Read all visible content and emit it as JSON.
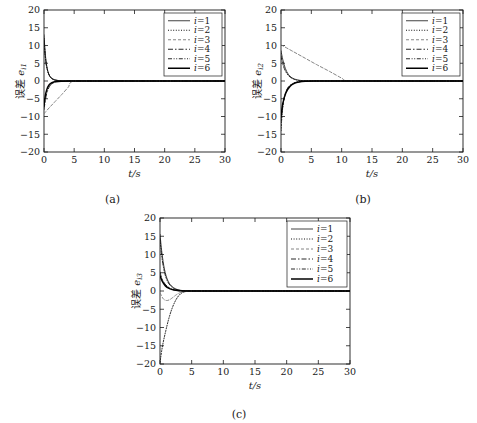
{
  "figure": {
    "title": "",
    "panels": [
      {
        "id": "a",
        "caption": "(a)",
        "xlabel": "t/s",
        "ylabel_cn": "误差",
        "ylabel_sym": "e",
        "ylabel_sub": "i1"
      },
      {
        "id": "b",
        "caption": "(b)",
        "xlabel": "t/s",
        "ylabel_cn": "误差",
        "ylabel_sym": "e",
        "ylabel_sub": "i2"
      },
      {
        "id": "c",
        "caption": "(c)",
        "xlabel": "t/s",
        "ylabel_cn": "误差",
        "ylabel_sym": "e",
        "ylabel_sub": "i3"
      }
    ],
    "legend_entries": [
      {
        "label": "i=1",
        "style": "solid-thin",
        "color": "#111111"
      },
      {
        "label": "i=2",
        "style": "dotted",
        "color": "#111111"
      },
      {
        "label": "i=3",
        "style": "dashed",
        "color": "#777777"
      },
      {
        "label": "i=4",
        "style": "dashdot",
        "color": "#111111"
      },
      {
        "label": "i=5",
        "style": "dashdotdot",
        "color": "#111111"
      },
      {
        "label": "i=6",
        "style": "solid-thick",
        "color": "#000000"
      }
    ]
  },
  "chart_data": [
    {
      "type": "line",
      "panel": "a",
      "title": "",
      "xlabel": "t/s",
      "ylabel": "误差 e_i1",
      "xlim": [
        0,
        30
      ],
      "ylim": [
        -20,
        20
      ],
      "xticks": [
        0,
        5,
        10,
        15,
        20,
        25,
        30
      ],
      "yticks": [
        -20,
        -15,
        -10,
        -5,
        0,
        5,
        10,
        15,
        20
      ],
      "grid": false,
      "legend_position": "top-right",
      "series": [
        {
          "name": "i=1",
          "style": "solid-thin",
          "color": "#111111",
          "x": [
            0,
            0.15,
            0.3,
            0.5,
            0.8,
            1.2,
            1.8,
            2.5,
            3.5,
            5,
            8,
            15,
            30
          ],
          "y": [
            13.0,
            9.0,
            6.2,
            3.8,
            1.9,
            0.8,
            0.25,
            0.08,
            0.02,
            0.0,
            0.0,
            0.0,
            0.0
          ]
        },
        {
          "name": "i=2",
          "style": "dotted",
          "color": "#111111",
          "x": [
            0,
            0.2,
            0.4,
            0.7,
            1.1,
            1.7,
            2.5,
            3.5,
            5,
            10,
            30
          ],
          "y": [
            12.0,
            7.5,
            4.5,
            2.3,
            1.0,
            0.35,
            0.1,
            0.03,
            0.0,
            0.0,
            0.0
          ]
        },
        {
          "name": "i=3",
          "style": "dashed",
          "color": "#777777",
          "x": [
            0,
            1,
            2,
            3,
            4,
            5,
            10,
            20,
            30
          ],
          "y": [
            -9.2,
            -7.3,
            -5.5,
            -3.7,
            -1.8,
            0.0,
            0.0,
            0.0,
            0.0
          ]
        },
        {
          "name": "i=4",
          "style": "dashdot",
          "color": "#111111",
          "x": [
            0,
            0.25,
            0.5,
            0.9,
            1.4,
            2.0,
            3.0,
            4.5,
            8,
            30
          ],
          "y": [
            -8.0,
            -5.2,
            -3.2,
            -1.6,
            -0.7,
            -0.25,
            -0.06,
            -0.01,
            0.0,
            0.0
          ]
        },
        {
          "name": "i=5",
          "style": "dashdotdot",
          "color": "#111111",
          "x": [
            0,
            0.2,
            0.45,
            0.8,
            1.3,
            2.0,
            3.0,
            4.5,
            8,
            30
          ],
          "y": [
            11.5,
            6.8,
            3.9,
            1.9,
            0.8,
            0.25,
            0.06,
            0.01,
            0.0,
            0.0
          ]
        },
        {
          "name": "i=6",
          "style": "solid-thick",
          "color": "#000000",
          "x": [
            0,
            0.2,
            0.45,
            0.8,
            1.3,
            2.0,
            3.0,
            4.5,
            8,
            30
          ],
          "y": [
            -7.0,
            -4.3,
            -2.5,
            -1.2,
            -0.5,
            -0.15,
            -0.04,
            0.0,
            0.0,
            0.0
          ]
        }
      ]
    },
    {
      "type": "line",
      "panel": "b",
      "title": "",
      "xlabel": "t/s",
      "ylabel": "误差 e_i2",
      "xlim": [
        0,
        30
      ],
      "ylim": [
        -20,
        20
      ],
      "xticks": [
        0,
        5,
        10,
        15,
        20,
        25,
        30
      ],
      "yticks": [
        -20,
        -15,
        -10,
        -5,
        0,
        5,
        10,
        15,
        20
      ],
      "grid": false,
      "legend_position": "top-right",
      "series": [
        {
          "name": "i=1",
          "style": "solid-thin",
          "color": "#111111",
          "x": [
            0,
            0.3,
            0.7,
            1.2,
            1.8,
            2.6,
            3.5,
            5,
            8,
            30
          ],
          "y": [
            8.5,
            6.0,
            3.6,
            1.9,
            0.9,
            0.35,
            0.12,
            0.02,
            0.0,
            0.0
          ]
        },
        {
          "name": "i=2",
          "style": "dotted",
          "color": "#111111",
          "x": [
            0,
            0.2,
            0.5,
            1.0,
            1.6,
            2.4,
            3.4,
            5,
            8,
            30
          ],
          "y": [
            -14.0,
            -9.0,
            -5.0,
            -2.4,
            -1.1,
            -0.4,
            -0.12,
            -0.02,
            0.0,
            0.0
          ]
        },
        {
          "name": "i=3",
          "style": "dashed",
          "color": "#777777",
          "x": [
            0,
            2,
            4,
            6,
            8,
            10,
            11,
            15,
            20,
            30
          ],
          "y": [
            10.2,
            8.3,
            6.4,
            4.5,
            2.7,
            0.8,
            0.0,
            0.0,
            0.0,
            0.0
          ]
        },
        {
          "name": "i=4",
          "style": "dashdot",
          "color": "#111111",
          "x": [
            0,
            0.25,
            0.6,
            1.1,
            1.8,
            2.6,
            3.6,
            5,
            8,
            30
          ],
          "y": [
            -11.5,
            -7.5,
            -4.2,
            -2.0,
            -0.9,
            -0.3,
            -0.1,
            -0.02,
            0.0,
            0.0
          ]
        },
        {
          "name": "i=5",
          "style": "dashdotdot",
          "color": "#111111",
          "x": [
            0,
            0.3,
            0.7,
            1.3,
            2.0,
            2.8,
            3.8,
            5,
            8,
            30
          ],
          "y": [
            7.0,
            4.8,
            2.9,
            1.4,
            0.6,
            0.2,
            0.06,
            0.01,
            0.0,
            0.0
          ]
        },
        {
          "name": "i=6",
          "style": "solid-thick",
          "color": "#000000",
          "x": [
            0,
            0.3,
            0.8,
            1.5,
            2.2,
            3.0,
            4.0,
            5.5,
            9,
            30
          ],
          "y": [
            -10.0,
            -6.3,
            -3.4,
            -1.5,
            -0.65,
            -0.25,
            -0.08,
            -0.01,
            0.0,
            0.0
          ]
        }
      ]
    },
    {
      "type": "line",
      "panel": "c",
      "title": "",
      "xlabel": "t/s",
      "ylabel": "误差 e_i3",
      "xlim": [
        0,
        30
      ],
      "ylim": [
        -20,
        20
      ],
      "xticks": [
        0,
        5,
        10,
        15,
        20,
        25,
        30
      ],
      "yticks": [
        -20,
        -15,
        -10,
        -5,
        0,
        5,
        10,
        15,
        20
      ],
      "grid": false,
      "legend_position": "top-right",
      "series": [
        {
          "name": "i=1",
          "style": "solid-thin",
          "color": "#111111",
          "x": [
            0,
            0.3,
            0.7,
            1.2,
            1.8,
            2.5,
            3.3,
            4.5,
            8,
            30
          ],
          "y": [
            15.5,
            10.5,
            6.0,
            3.0,
            1.4,
            0.55,
            0.18,
            0.04,
            0.0,
            0.0
          ]
        },
        {
          "name": "i=2",
          "style": "dotted",
          "color": "#111111",
          "x": [
            0,
            0.4,
            0.9,
            1.4,
            1.9,
            2.4,
            2.9,
            3.4,
            4.0,
            6,
            30
          ],
          "y": [
            -19.5,
            -15.0,
            -11.0,
            -7.5,
            -4.8,
            -2.8,
            -1.4,
            -0.6,
            -0.2,
            0.0,
            0.0
          ]
        },
        {
          "name": "i=3",
          "style": "dashed",
          "color": "#777777",
          "x": [
            0,
            0.5,
            1.0,
            1.5,
            2.0,
            2.6,
            3.2,
            4.0,
            6,
            30
          ],
          "y": [
            -0.5,
            -2.1,
            -2.6,
            -2.4,
            -1.8,
            -1.0,
            -0.45,
            -0.15,
            0.0,
            0.0
          ]
        },
        {
          "name": "i=4",
          "style": "dashdot",
          "color": "#111111",
          "x": [
            0,
            0.3,
            0.8,
            1.4,
            2.0,
            2.7,
            3.5,
            5,
            9,
            30
          ],
          "y": [
            5.2,
            3.4,
            1.9,
            0.95,
            0.42,
            0.16,
            0.05,
            0.01,
            0.0,
            0.0
          ]
        },
        {
          "name": "i=5",
          "style": "dashdotdot",
          "color": "#111111",
          "x": [
            0,
            0.3,
            0.7,
            1.2,
            1.8,
            2.5,
            3.3,
            4.6,
            8,
            30
          ],
          "y": [
            14.0,
            9.2,
            5.2,
            2.6,
            1.2,
            0.45,
            0.15,
            0.03,
            0.0,
            0.0
          ]
        },
        {
          "name": "i=6",
          "style": "solid-thick",
          "color": "#000000",
          "x": [
            0,
            0.35,
            0.85,
            1.5,
            2.2,
            3.0,
            4.0,
            5.5,
            9,
            30
          ],
          "y": [
            4.2,
            2.7,
            1.4,
            0.65,
            0.26,
            0.09,
            0.03,
            0.0,
            0.0,
            0.0
          ]
        }
      ]
    }
  ]
}
